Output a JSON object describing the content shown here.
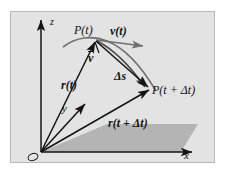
{
  "figure": {
    "type": "vector-kinematics-diagram",
    "background_color": "#e3e3e3",
    "plane_color": "#b0b0b0",
    "ink_color": "#141414",
    "axes": {
      "x_label": "x",
      "y_label": "y",
      "z_label": "z",
      "origin_label": "O"
    },
    "labels": {
      "point_t": "P(t)",
      "point_t_dt": "P(t + Δt)",
      "velocity": "v(t)",
      "average_velocity": "v",
      "arc_length": "Δs",
      "position_t": "r(t)",
      "position_t_dt": "r(t + Δt)"
    },
    "elements": [
      "trajectory-curve",
      "position-vector-rt",
      "position-vector-rt-dt",
      "velocity-vector",
      "average-velocity-vector",
      "displacement-arc",
      "xy-plane"
    ]
  }
}
